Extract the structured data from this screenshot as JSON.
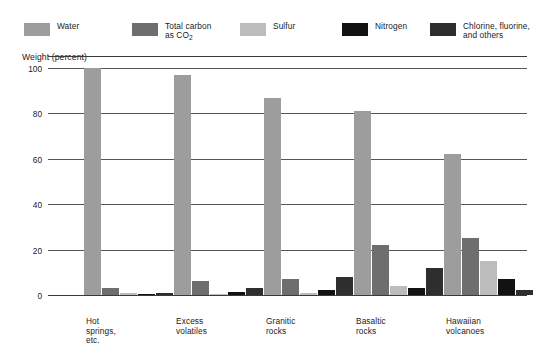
{
  "legend": {
    "items": [
      {
        "label": "Water",
        "color": "#9d9d9d",
        "name": "water"
      },
      {
        "label": "Total carbon\nas CO2",
        "label_main": "Total carbon",
        "label_sub_pre": "as CO",
        "label_sub": "2",
        "color": "#6e6e6e",
        "name": "total-carbon"
      },
      {
        "label": "Sulfur",
        "color": "#bcbcbc",
        "name": "sulfur"
      },
      {
        "label": "Nitrogen",
        "color": "#121212",
        "name": "nitrogen"
      },
      {
        "label": "Chlorine, fluorine,\nand others",
        "color": "#2e2e2e",
        "name": "chlorine-fluorine-others"
      }
    ]
  },
  "chart_data": {
    "type": "bar",
    "title": "",
    "xlabel": "",
    "ylabel": "Weight (percent)",
    "ylim": [
      0,
      100
    ],
    "yticks": [
      0,
      20,
      40,
      60,
      80,
      100
    ],
    "ytick_labels": [
      "0",
      "20",
      "40",
      "60",
      "80",
      "100"
    ],
    "grid": true,
    "legend_position": "top",
    "categories": [
      "Hot springs,\netc.",
      "Excess\nvolatiles",
      "Granitic\nrocks",
      "Basaltic\nrocks",
      "Hawaiian\nvolcanoes"
    ],
    "series": [
      {
        "name": "Water",
        "color": "#9d9d9d",
        "values": [
          100,
          97,
          87,
          81,
          62
        ]
      },
      {
        "name": "Total carbon as CO2",
        "color": "#6e6e6e",
        "values": [
          3,
          6,
          7,
          22,
          25
        ]
      },
      {
        "name": "Sulfur",
        "color": "#bcbcbc",
        "values": [
          1,
          0.5,
          1,
          4,
          15
        ]
      },
      {
        "name": "Nitrogen",
        "color": "#121212",
        "values": [
          0.5,
          1.5,
          2,
          3,
          7
        ]
      },
      {
        "name": "Chlorine, fluorine, and others",
        "color": "#2e2e2e",
        "values": [
          1,
          3,
          8,
          12,
          2
        ]
      }
    ]
  }
}
